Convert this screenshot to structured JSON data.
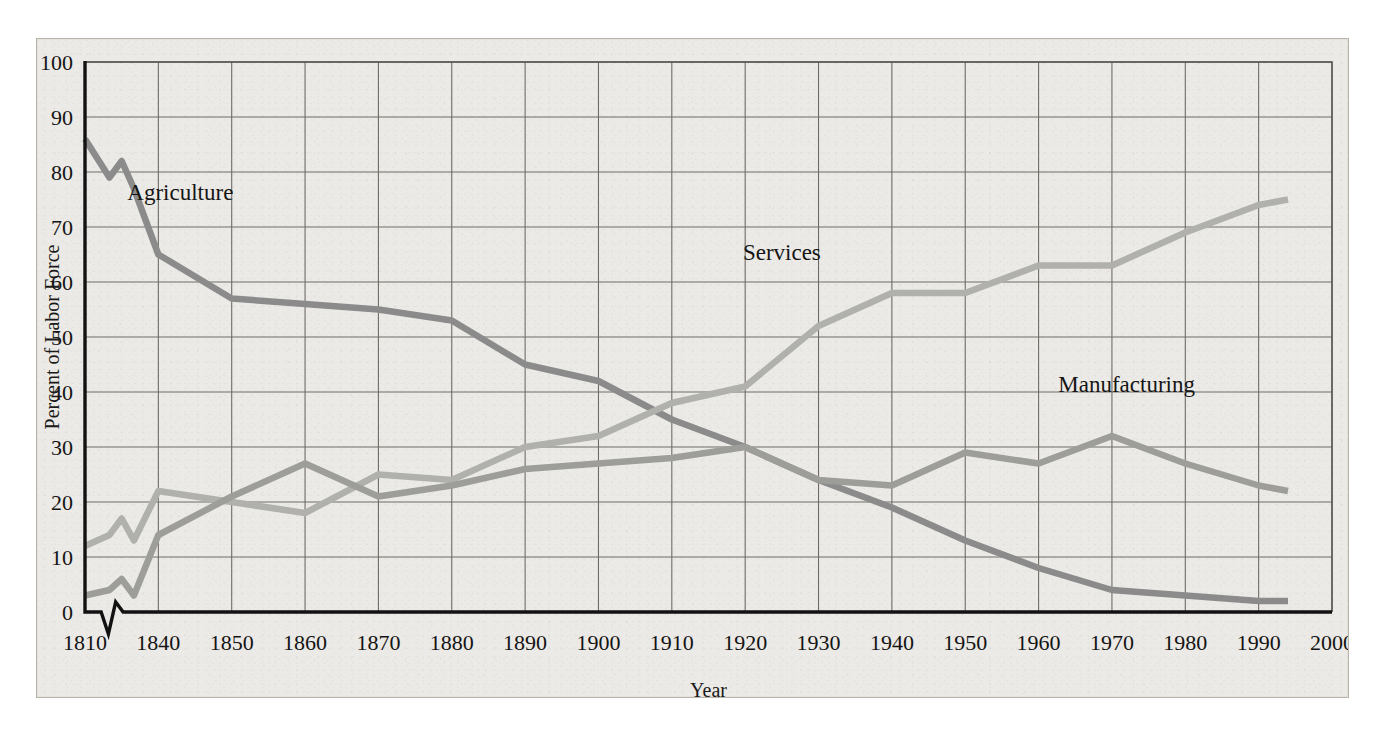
{
  "figure": {
    "background_color": "#eceae6",
    "frame_color": "#54524e"
  },
  "chart_data": {
    "type": "line",
    "title": "",
    "xlabel": "Year",
    "ylabel": "Percent of Labor Force",
    "xlim": [
      1810,
      2000
    ],
    "ylim": [
      0,
      100
    ],
    "grid": true,
    "legend_position": "inline-labels",
    "axis_break": {
      "present": true,
      "between": [
        1810,
        1840
      ],
      "note": "zigzag break drawn on x-axis between 1810 and 1840"
    },
    "x_tick_labels": [
      "1810",
      "1840",
      "1850",
      "1860",
      "1870",
      "1880",
      "1890",
      "1900",
      "1910",
      "1920",
      "1930",
      "1940",
      "1950",
      "1960",
      "1970",
      "1980",
      "1990",
      "2000"
    ],
    "y_tick_labels": [
      "0",
      "10",
      "20",
      "30",
      "40",
      "50",
      "60",
      "70",
      "80",
      "90",
      "100"
    ],
    "categories": [
      1810,
      1820,
      1825,
      1830,
      1840,
      1850,
      1860,
      1870,
      1880,
      1890,
      1900,
      1910,
      1920,
      1930,
      1940,
      1950,
      1960,
      1970,
      1980,
      1990,
      1994
    ],
    "series": [
      {
        "name": "Agriculture",
        "color": "#8b8b8b",
        "label_x": 1843,
        "label_y": 75,
        "values": [
          86,
          79,
          82,
          77,
          65,
          57,
          56,
          55,
          53,
          45,
          42,
          35,
          30,
          24,
          19,
          13,
          8,
          4,
          3,
          2,
          2
        ]
      },
      {
        "name": "Services",
        "color": "#b0b0ac",
        "label_x": 1925,
        "label_y": 64,
        "values": [
          12,
          14,
          17,
          13,
          22,
          20,
          18,
          25,
          24,
          30,
          32,
          38,
          41,
          52,
          58,
          58,
          63,
          63,
          69,
          74,
          75
        ]
      },
      {
        "name": "Manufacturing",
        "color": "#9d9d9a",
        "label_x": 1972,
        "label_y": 40,
        "values": [
          3,
          4,
          6,
          3,
          14,
          21,
          27,
          21,
          23,
          26,
          27,
          28,
          30,
          24,
          23,
          29,
          27,
          32,
          27,
          23,
          22
        ]
      }
    ]
  }
}
